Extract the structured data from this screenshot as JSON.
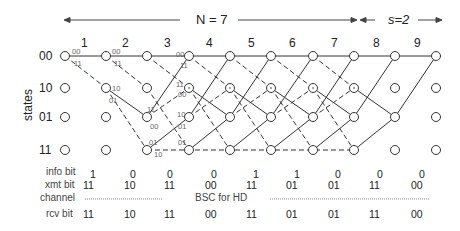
{
  "header": {
    "n_label": "N = 7",
    "s_label": "s=2"
  },
  "columns": [
    "1",
    "2",
    "3",
    "4",
    "5",
    "6",
    "7",
    "8",
    "9"
  ],
  "states": {
    "axis_label": "states",
    "rows": [
      "00",
      "10",
      "01",
      "11"
    ]
  },
  "edge_labels": {
    "col1_00_00": "00",
    "col1_00_11": "11",
    "col2_00_00": "00",
    "col2_00_11": "11",
    "col2_10_10": "10",
    "col2_10_01": "01",
    "col3_01_11": "11",
    "col3_01_00": "00",
    "col3_11_01": "01",
    "col3_11_10": "10",
    "col4_00_00": "00",
    "col4_00_11": "11",
    "col4_10_11": "11",
    "col4_10_00": "00",
    "col4_01_10": "10",
    "col4_01_01": "01",
    "col4_11_01": "01"
  },
  "table": {
    "info_bit": {
      "label": "info bit",
      "values": [
        "1",
        "0",
        "0",
        "0",
        "1",
        "1",
        "0",
        "0",
        "0"
      ]
    },
    "xmt_bit": {
      "label": "xmt bit",
      "values": [
        "11",
        "10",
        "11",
        "00",
        "11",
        "01",
        "01",
        "11",
        "00"
      ]
    },
    "channel": {
      "label": "channel",
      "text": "BSC for HD"
    },
    "rcv_bit": {
      "label": "rcv bit",
      "values": [
        "11",
        "10",
        "11",
        "00",
        "11",
        "01",
        "01",
        "11",
        "00"
      ]
    }
  }
}
